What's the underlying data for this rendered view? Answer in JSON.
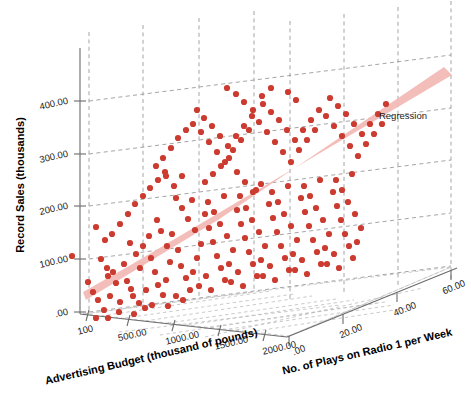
{
  "chart_data": {
    "type": "scatter",
    "projection": "3d",
    "title": "",
    "xlabel": "Advertising Budget (thousand of pounds)",
    "ylabel": "Record Sales (thousands)",
    "zlabel": "No. of Plays on Radio 1 per Week",
    "xticks": [
      "100",
      "500.00",
      "1000.00",
      "1500.00",
      "2000.00"
    ],
    "xtickvalues": [
      100,
      500,
      1000,
      1500,
      2000
    ],
    "yticks": [
      ".00",
      "100.00",
      "200.00",
      "300.00",
      "400.00"
    ],
    "ytickvalues": [
      0,
      100,
      200,
      300,
      400
    ],
    "zticks": [
      ".00",
      "20.00",
      "40.00",
      "60.00"
    ],
    "ztickvalues": [
      0,
      20,
      40,
      60
    ],
    "xlim": [
      0,
      2300
    ],
    "ylim": [
      0,
      450
    ],
    "zlim": [
      0,
      65
    ],
    "grid": true,
    "legend": [
      "Regression"
    ],
    "legend_position": "right",
    "point_color": "#cc3b30",
    "plane_color": "#f2b9b4",
    "grid_color": "#9a9a9a",
    "axis_color": "#6b6b6b",
    "n_points": 200,
    "series": [
      {
        "name": "Record Sales",
        "points_px": [
          [
            72,
            256
          ],
          [
            96,
            227
          ],
          [
            105,
            240
          ],
          [
            101,
            259
          ],
          [
            107,
            268
          ],
          [
            108,
            276
          ],
          [
            116,
            283
          ],
          [
            110,
            296
          ],
          [
            113,
            272
          ],
          [
            124,
            264
          ],
          [
            127,
            281
          ],
          [
            131,
            289
          ],
          [
            98,
            300
          ],
          [
            120,
            302
          ],
          [
            133,
            296
          ],
          [
            140,
            268
          ],
          [
            136,
            254
          ],
          [
            143,
            246
          ],
          [
            130,
            243
          ],
          [
            149,
            236
          ],
          [
            151,
            258
          ],
          [
            155,
            272
          ],
          [
            158,
            285
          ],
          [
            163,
            295
          ],
          [
            146,
            290
          ],
          [
            139,
            303
          ],
          [
            152,
            305
          ],
          [
            166,
            280
          ],
          [
            170,
            262
          ],
          [
            167,
            246
          ],
          [
            161,
            231
          ],
          [
            157,
            220
          ],
          [
            172,
            234
          ],
          [
            178,
            250
          ],
          [
            181,
            266
          ],
          [
            186,
            278
          ],
          [
            190,
            290
          ],
          [
            176,
            296
          ],
          [
            168,
            306
          ],
          [
            183,
            300
          ],
          [
            193,
            272
          ],
          [
            197,
            258
          ],
          [
            201,
            244
          ],
          [
            195,
            230
          ],
          [
            188,
            219
          ],
          [
            182,
            208
          ],
          [
            176,
            198
          ],
          [
            192,
            200
          ],
          [
            205,
            214
          ],
          [
            209,
            228
          ],
          [
            213,
            242
          ],
          [
            217,
            256
          ],
          [
            221,
            268
          ],
          [
            206,
            276
          ],
          [
            199,
            286
          ],
          [
            211,
            290
          ],
          [
            225,
            280
          ],
          [
            229,
            264
          ],
          [
            233,
            250
          ],
          [
            227,
            236
          ],
          [
            220,
            224
          ],
          [
            214,
            212
          ],
          [
            208,
            202
          ],
          [
            224,
            196
          ],
          [
            237,
            210
          ],
          [
            241,
            224
          ],
          [
            245,
            238
          ],
          [
            249,
            252
          ],
          [
            253,
            264
          ],
          [
            238,
            272
          ],
          [
            231,
            282
          ],
          [
            243,
            286
          ],
          [
            257,
            276
          ],
          [
            261,
            260
          ],
          [
            265,
            246
          ],
          [
            259,
            232
          ],
          [
            252,
            220
          ],
          [
            246,
            208
          ],
          [
            240,
            196
          ],
          [
            256,
            190
          ],
          [
            269,
            204
          ],
          [
            273,
            218
          ],
          [
            277,
            232
          ],
          [
            281,
            246
          ],
          [
            285,
            258
          ],
          [
            270,
            266
          ],
          [
            263,
            276
          ],
          [
            275,
            280
          ],
          [
            289,
            270
          ],
          [
            293,
            254
          ],
          [
            297,
            240
          ],
          [
            291,
            226
          ],
          [
            284,
            214
          ],
          [
            278,
            202
          ],
          [
            272,
            192
          ],
          [
            288,
            186
          ],
          [
            301,
            198
          ],
          [
            305,
            212
          ],
          [
            309,
            226
          ],
          [
            313,
            240
          ],
          [
            317,
            252
          ],
          [
            302,
            260
          ],
          [
            295,
            270
          ],
          [
            307,
            274
          ],
          [
            321,
            264
          ],
          [
            325,
            248
          ],
          [
            329,
            234
          ],
          [
            323,
            220
          ],
          [
            316,
            208
          ],
          [
            310,
            196
          ],
          [
            304,
            186
          ],
          [
            320,
            180
          ],
          [
            333,
            192
          ],
          [
            337,
            206
          ],
          [
            341,
            220
          ],
          [
            345,
            234
          ],
          [
            349,
            246
          ],
          [
            334,
            254
          ],
          [
            327,
            264
          ],
          [
            339,
            268
          ],
          [
            353,
            258
          ],
          [
            357,
            242
          ],
          [
            361,
            228
          ],
          [
            355,
            214
          ],
          [
            348,
            202
          ],
          [
            342,
            190
          ],
          [
            336,
            180
          ],
          [
            352,
            174
          ],
          [
            156,
            166
          ],
          [
            163,
            158
          ],
          [
            171,
            148
          ],
          [
            178,
            138
          ],
          [
            186,
            130
          ],
          [
            166,
            176
          ],
          [
            174,
            186
          ],
          [
            182,
            176
          ],
          [
            193,
            124
          ],
          [
            201,
            132
          ],
          [
            209,
            142
          ],
          [
            217,
            152
          ],
          [
            225,
            162
          ],
          [
            233,
            150
          ],
          [
            241,
            140
          ],
          [
            249,
            130
          ],
          [
            197,
            110
          ],
          [
            204,
            118
          ],
          [
            212,
            126
          ],
          [
            220,
            136
          ],
          [
            228,
            146
          ],
          [
            236,
            136
          ],
          [
            244,
            126
          ],
          [
            252,
            116
          ],
          [
            259,
            122
          ],
          [
            267,
            132
          ],
          [
            275,
            142
          ],
          [
            283,
            152
          ],
          [
            291,
            162
          ],
          [
            299,
            150
          ],
          [
            307,
            140
          ],
          [
            315,
            130
          ],
          [
            263,
            104
          ],
          [
            271,
            112
          ],
          [
            279,
            120
          ],
          [
            287,
            130
          ],
          [
            295,
            140
          ],
          [
            303,
            130
          ],
          [
            311,
            120
          ],
          [
            319,
            110
          ],
          [
            326,
            116
          ],
          [
            334,
            126
          ],
          [
            342,
            136
          ],
          [
            350,
            146
          ],
          [
            358,
            156
          ],
          [
            366,
            144
          ],
          [
            374,
            134
          ],
          [
            382,
            124
          ],
          [
            330,
            98
          ],
          [
            338,
            106
          ],
          [
            346,
            114
          ],
          [
            354,
            124
          ],
          [
            362,
            134
          ],
          [
            370,
            124
          ],
          [
            378,
            114
          ],
          [
            386,
            104
          ],
          [
            128,
            214
          ],
          [
            135,
            204
          ],
          [
            120,
            224
          ],
          [
            112,
            234
          ],
          [
            143,
            196
          ],
          [
            150,
            188
          ],
          [
            158,
            180
          ],
          [
            165,
            172
          ],
          [
            88,
            282
          ],
          [
            93,
            292
          ],
          [
            104,
            310
          ],
          [
            119,
            312
          ],
          [
            134,
            314
          ],
          [
            108,
            318
          ],
          [
            96,
            318
          ],
          [
            145,
            308
          ],
          [
            205,
            182
          ],
          [
            213,
            174
          ],
          [
            221,
            166
          ],
          [
            229,
            158
          ],
          [
            237,
            172
          ],
          [
            245,
            182
          ],
          [
            253,
            192
          ],
          [
            261,
            184
          ],
          [
            227,
            88
          ],
          [
            236,
            94
          ],
          [
            288,
            92
          ],
          [
            296,
            100
          ],
          [
            244,
            102
          ],
          [
            253,
            110
          ],
          [
            262,
            96
          ],
          [
            271,
            88
          ]
        ]
      }
    ],
    "plane_polygon_px": [
      [
        83,
        292
      ],
      [
        127,
        267
      ],
      [
        452,
        74
      ],
      [
        445,
        68
      ],
      [
        222,
        218
      ]
    ]
  },
  "legend": {
    "regression_label": "Regression"
  },
  "axes": {
    "y_title": "Record Sales (thousands)",
    "x_title": "Advertising Budget (thousand of pounds)",
    "z_title": "No. of Plays on Radio 1 per Week",
    "y_ticks": [
      {
        "label": "400.00",
        "y": 101
      },
      {
        "label": "300.00",
        "y": 154
      },
      {
        "label": "200.00",
        "y": 206
      },
      {
        "label": "100.00",
        "y": 259
      },
      {
        "label": ".00",
        "y": 312
      }
    ],
    "x_ticks": [
      {
        "label": "100",
        "x": 89
      },
      {
        "label": "500.00",
        "x": 128
      },
      {
        "label": "1000.00",
        "x": 173
      },
      {
        "label": "1500.00",
        "x": 219
      },
      {
        "label": "2000.00",
        "x": 264
      }
    ],
    "z_ticks": [
      {
        "label": ".00",
        "x": 289
      },
      {
        "label": "20.00",
        "x": 343
      },
      {
        "label": "40.00",
        "x": 397
      },
      {
        "label": "60.00",
        "x": 450
      }
    ]
  }
}
